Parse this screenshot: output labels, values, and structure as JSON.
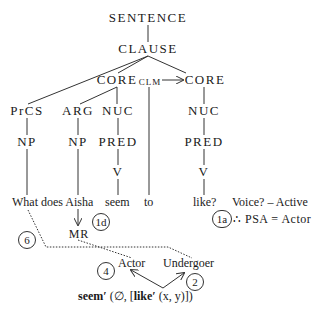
{
  "tree": {
    "root": "SENTENCE",
    "clause": "CLAUSE",
    "core_left": "CORE",
    "clm": "CLM",
    "core_right": "CORE",
    "prcs": "PrCS",
    "arg": "ARG",
    "nuc_left": "NUC",
    "nuc_right": "NUC",
    "np_prcs": "NP",
    "np_arg": "NP",
    "pred_left": "PRED",
    "pred_right": "PRED",
    "v_left": "V",
    "v_right": "V"
  },
  "words": {
    "what_does_aisha": "What does Aisha",
    "seem": "seem",
    "to": "to",
    "like": "like?"
  },
  "annotations": {
    "voice": "Voice? – Active",
    "psa": "∴ PSA = Actor",
    "mr": "MR",
    "actor": "Actor",
    "undergoer": "Undergoer"
  },
  "steps": {
    "s1a": "1a",
    "s1d": "1d",
    "s2": "2",
    "s4": "4",
    "s6": "6"
  },
  "logical_structure": {
    "seem": "seem′",
    "open": " (∅, [",
    "like": "like′",
    "args": " (x, y)])"
  }
}
